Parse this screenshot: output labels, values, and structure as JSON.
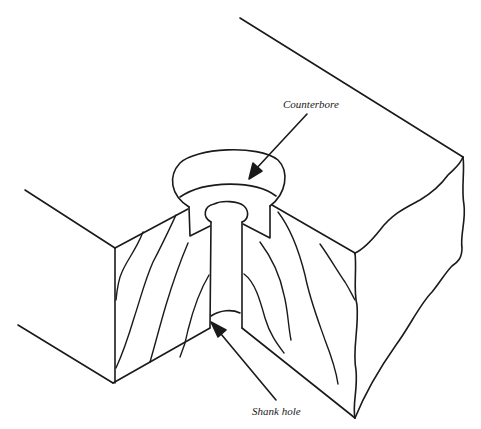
{
  "figure": {
    "type": "technical illustration",
    "stroke_color": "#1a1a1a",
    "background_color": "#ffffff"
  },
  "labels": {
    "counterbore": "Counterbore",
    "shank_hole": "Shank hole"
  }
}
